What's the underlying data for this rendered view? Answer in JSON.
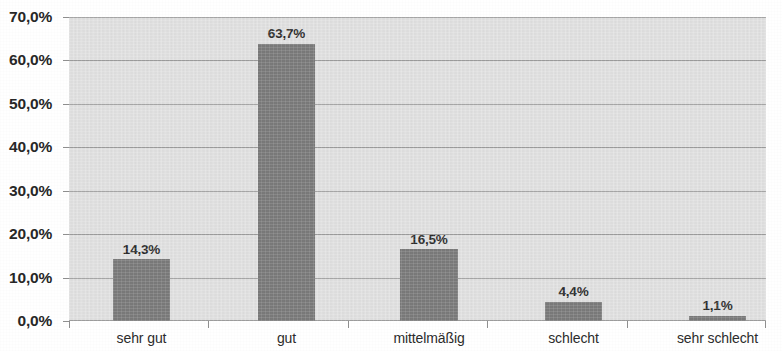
{
  "chart_data": {
    "type": "bar",
    "title": "",
    "subtitle": "",
    "xlabel": "",
    "ylabel": "",
    "categories": [
      "sehr gut",
      "gut",
      "mittelmäßig",
      "schlecht",
      "sehr schlecht"
    ],
    "values": [
      14.3,
      63.7,
      16.5,
      4.4,
      1.1
    ],
    "data_labels": [
      "14,3%",
      "63,7%",
      "16,5%",
      "4,4%",
      "1,1%"
    ],
    "ylim": [
      0,
      70
    ],
    "ytick_values": [
      0,
      10,
      20,
      30,
      40,
      50,
      60,
      70
    ],
    "ytick_labels": [
      "0,0%",
      "10,0%",
      "20,0%",
      "30,0%",
      "40,0%",
      "50,0%",
      "60,0%",
      "70,0%"
    ],
    "grid": true,
    "grid_axis": "y",
    "legend": false,
    "legend_position": "none",
    "bar_color": "#767676",
    "plot_background": "#e3e3e3",
    "gridline_color": "#9a9a9a",
    "axis_color": "#8f8f8f",
    "label_color": "#272727",
    "decimal_separator": ","
  }
}
